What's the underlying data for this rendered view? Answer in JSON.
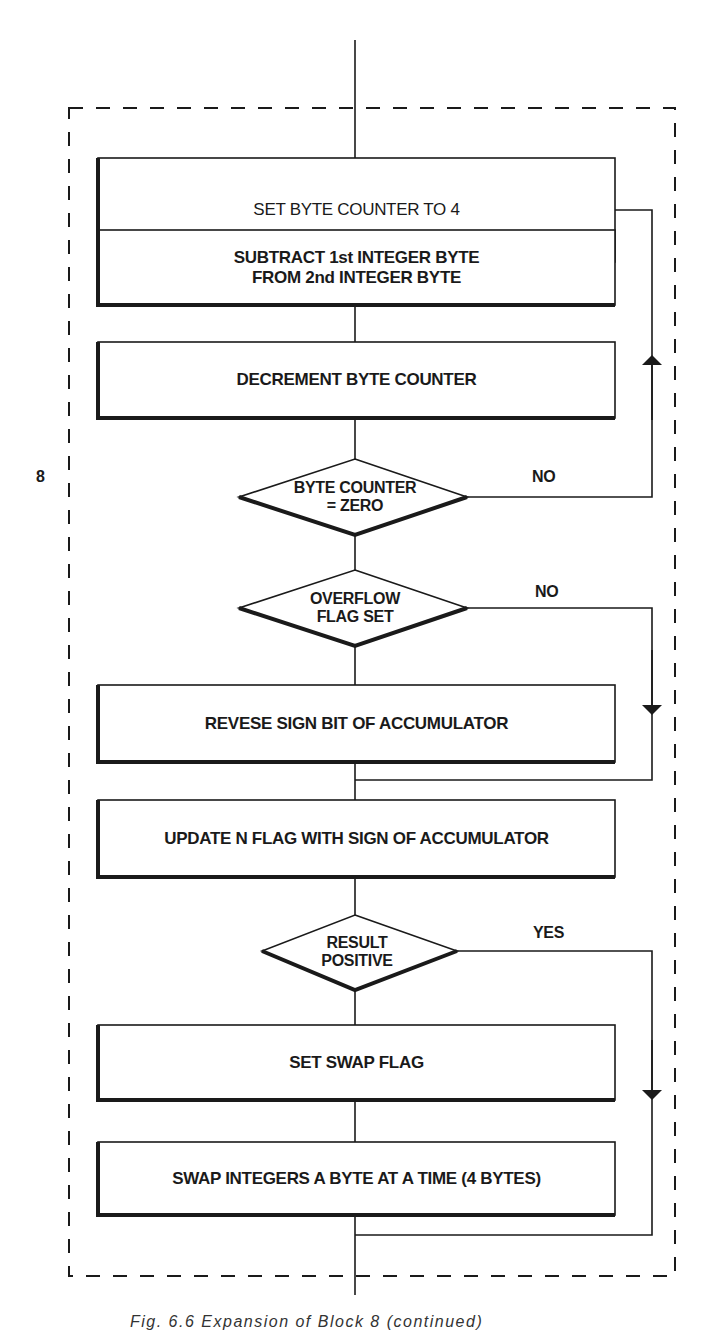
{
  "diagram": {
    "type": "flowchart",
    "side_marker": "8",
    "caption": "Fig. 6.6 Expansion of Block 8 (continued)",
    "colors": {
      "ink": "#1a1a1a",
      "background": "#ffffff"
    },
    "nodes": [
      {
        "id": "n1",
        "kind": "process",
        "label": "SET BYTE COUNTER TO 4"
      },
      {
        "id": "n2",
        "kind": "process",
        "line1": "SUBTRACT 1st INTEGER BYTE",
        "line2": "FROM 2nd INTEGER BYTE"
      },
      {
        "id": "n3",
        "kind": "process",
        "label": "DECREMENT BYTE COUNTER"
      },
      {
        "id": "d1",
        "kind": "decision",
        "line1": "BYTE COUNTER",
        "line2": "= ZERO",
        "no_label": "NO"
      },
      {
        "id": "d2",
        "kind": "decision",
        "line1": "OVERFLOW",
        "line2": "FLAG SET",
        "no_label": "NO"
      },
      {
        "id": "n4",
        "kind": "process",
        "label": "REVESE SIGN BIT OF ACCUMULATOR"
      },
      {
        "id": "n5",
        "kind": "process",
        "label": "UPDATE N FLAG WITH SIGN OF ACCUMULATOR"
      },
      {
        "id": "d3",
        "kind": "decision",
        "line1": "RESULT",
        "line2": "POSITIVE",
        "yes_label": "YES"
      },
      {
        "id": "n6",
        "kind": "process",
        "label": "SET SWAP FLAG"
      },
      {
        "id": "n7",
        "kind": "process",
        "label": "SWAP INTEGERS A BYTE AT A TIME (4 BYTES)"
      }
    ],
    "edges": [
      {
        "from": "n1",
        "to": "n2"
      },
      {
        "from": "n2",
        "to": "n3"
      },
      {
        "from": "n3",
        "to": "d1"
      },
      {
        "from": "d1",
        "to": "n2",
        "label": "NO",
        "route": "loop back up right side"
      },
      {
        "from": "d1",
        "to": "d2",
        "label": "YES (implicit)"
      },
      {
        "from": "d2",
        "to": "n4",
        "label": "YES (implicit)"
      },
      {
        "from": "d2",
        "to": "n5",
        "label": "NO",
        "route": "bypass down right side"
      },
      {
        "from": "n4",
        "to": "n5"
      },
      {
        "from": "n5",
        "to": "d3"
      },
      {
        "from": "d3",
        "to": "n6",
        "label": "NO (implicit)"
      },
      {
        "from": "d3",
        "to": "exit",
        "label": "YES",
        "route": "bypass down right side"
      },
      {
        "from": "n6",
        "to": "n7"
      },
      {
        "from": "n7",
        "to": "exit"
      }
    ]
  }
}
